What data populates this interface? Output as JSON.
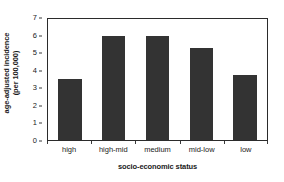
{
  "chart_data": {
    "type": "bar",
    "title": "",
    "categories": [
      "high",
      "high-mid",
      "medium",
      "mid-low",
      "low"
    ],
    "values": [
      3.5,
      5.9,
      5.9,
      5.25,
      3.7
    ],
    "xlabel": "socio-economic status",
    "ylabel_line1": "age-adjusted incidence",
    "ylabel_line2": "(per 100,000)",
    "ylim": [
      0,
      7
    ],
    "yticks": [
      0,
      1,
      2,
      3,
      4,
      5,
      6,
      7
    ],
    "ytick_labels": [
      "0",
      "1",
      "2",
      "3",
      "4",
      "5",
      "6",
      "7"
    ],
    "grid": false,
    "legend": "none",
    "bar_color": "#333333",
    "frame_color": "#2b2b2b",
    "background_color": "#ffffff"
  }
}
